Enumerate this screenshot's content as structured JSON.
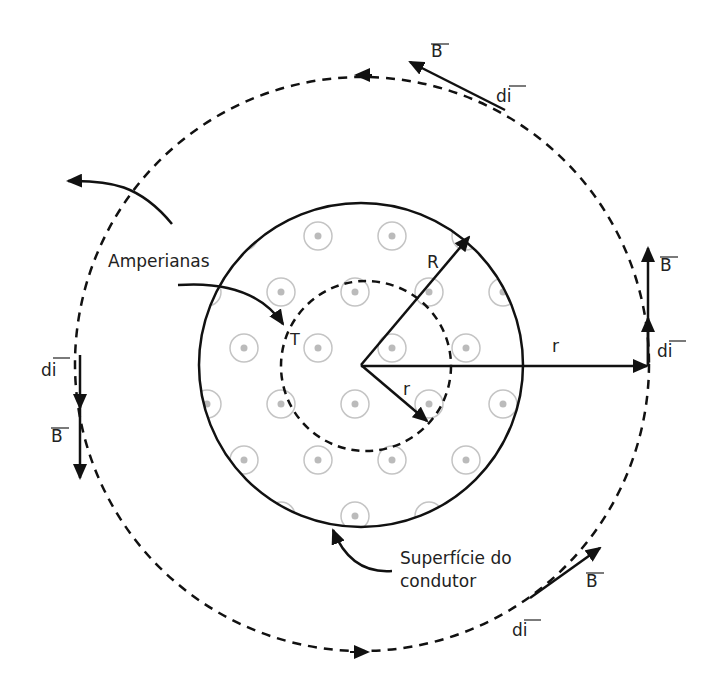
{
  "diagram": {
    "type": "ampere-law-cylindrical-conductor",
    "labels": {
      "amperianas": "Amperianas",
      "superficie_line1": "Superfície do",
      "superficie_line2": "condutor",
      "R": "R",
      "r_inner": "r",
      "r_outer": "r",
      "T": "T",
      "B_top": "B",
      "dl_top": "di",
      "B_right": "B",
      "dl_right": "di",
      "B_left": "B",
      "dl_left": "di",
      "B_bottom": "B",
      "dl_bottom": "di"
    },
    "colors": {
      "stroke": "#111111",
      "dots": "#bdbdbd",
      "text": "#222222",
      "background": "#ffffff"
    },
    "geometry": {
      "center": [
        361,
        365
      ],
      "conductor_radius": 162,
      "inner_amperian_radius": 85,
      "outer_amperian_radius": 287
    }
  }
}
